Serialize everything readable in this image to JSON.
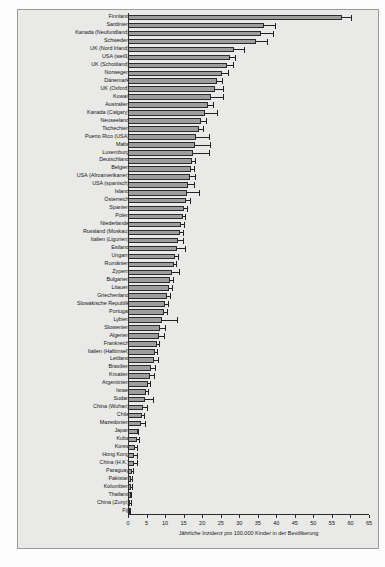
{
  "chart_data": {
    "type": "bar",
    "orientation": "horizontal",
    "title": "",
    "xlabel": "Jährliche Inzidenz pro 100.000 Kinder in der Bevölkerung",
    "ylabel": "",
    "xlim": [
      0,
      65
    ],
    "xticks": [
      0,
      5,
      10,
      15,
      20,
      25,
      30,
      35,
      40,
      45,
      50,
      55,
      60,
      65
    ],
    "grid": false,
    "legend": null,
    "bar_color": "#9e9e9c",
    "edge_color": "#2b2b2b",
    "error_bars": true,
    "categories": [
      "Finnland",
      "Sardinien",
      "Kanada (Neufundland)",
      "Schweden",
      "UK (Nord Irland)",
      "USA (weiß)",
      "UK (Schottland)",
      "Norwegen",
      "Dänemark",
      "UK (Oxford)",
      "Kuwait",
      "Australien",
      "Kanada (Calgary)",
      "Neuseeland",
      "Tschechien",
      "Puerto Rico (USA)",
      "Malta",
      "Luxemburg",
      "Deutschland",
      "Belgien",
      "USA (Afroamerikaner)",
      "USA (spanisch)",
      "Island",
      "Österreich",
      "Spanien",
      "Polen",
      "Niederlande",
      "Russland (Moskau)",
      "Italien (Ligurien)",
      "Estland",
      "Ungarn",
      "Rumänien",
      "Zypern",
      "Bulgarien",
      "Litauen",
      "Griechenland",
      "Slowakische Republik",
      "Portugal",
      "Lybien",
      "Slowenien",
      "Algerien",
      "Frankreich",
      "Italien (Halbinsel)",
      "Lettland",
      "Brasilien",
      "Kroatien",
      "Argentinien",
      "Israel",
      "Sudan",
      "China (Wuhan)",
      "Chile",
      "Mazedonien",
      "Japan",
      "Kuba",
      "Korea",
      "Hong Kong",
      "China (H.K.)",
      "Paraguay",
      "Pakistan",
      "Kolumbien",
      "Thailand",
      "China (Zunyi)",
      "Fiji"
    ],
    "values": [
      57.6,
      36.8,
      35.9,
      34.6,
      28.6,
      27.4,
      26.8,
      25.3,
      24.0,
      23.4,
      22.3,
      21.7,
      20.9,
      19.6,
      19.2,
      18.4,
      18.0,
      17.6,
      17.3,
      16.9,
      16.6,
      16.3,
      16.0,
      15.6,
      15.2,
      14.8,
      14.4,
      14.0,
      13.6,
      13.1,
      12.8,
      12.3,
      11.8,
      11.4,
      11.0,
      10.5,
      10.1,
      9.6,
      9.1,
      8.7,
      8.3,
      7.9,
      7.4,
      6.9,
      6.3,
      5.8,
      5.3,
      4.9,
      4.5,
      4.1,
      3.7,
      3.4,
      2.6,
      2.5,
      1.9,
      1.7,
      1.6,
      1.0,
      0.9,
      0.8,
      0.7,
      0.5,
      0.3
    ],
    "error_upper": [
      2.6,
      2.9,
      3.2,
      3.0,
      2.7,
      1.4,
      1.5,
      1.6,
      1.4,
      2.2,
      3.2,
      1.1,
      3.0,
      1.5,
      0.9,
      3.4,
      4.0,
      4.3,
      0.7,
      1.0,
      1.6,
      1.6,
      3.2,
      1.0,
      0.8,
      0.7,
      0.7,
      0.9,
      1.1,
      2.4,
      0.7,
      0.6,
      2.0,
      0.7,
      0.8,
      0.9,
      0.7,
      0.9,
      4.1,
      1.3,
      1.4,
      0.5,
      0.5,
      1.3,
      1.0,
      1.1,
      0.6,
      0.5,
      2.2,
      0.9,
      0.7,
      1.2,
      0.2,
      0.5,
      0.4,
      0.7,
      0.9,
      0.3,
      0.2,
      0.3,
      0.2,
      0.2,
      0.3
    ]
  },
  "axis": {
    "x_title": "Jährliche Inzidenz pro 100.000 Kinder in der Bevölkerung",
    "tick_labels": [
      "0",
      "5",
      "10",
      "15",
      "20",
      "25",
      "30",
      "35",
      "40",
      "45",
      "50",
      "55",
      "60",
      "65"
    ]
  }
}
